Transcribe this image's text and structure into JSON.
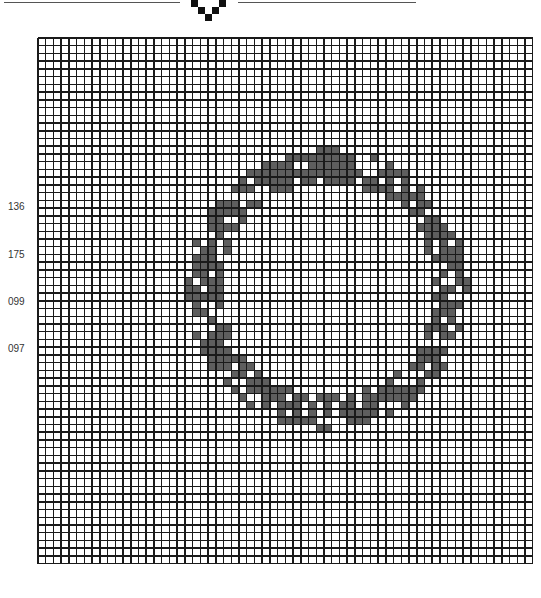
{
  "header": {
    "motif": "v-shaped-pixel-divider",
    "line_color": "#555555"
  },
  "legend": [
    {
      "code": "136",
      "color": "#5e5e5e",
      "y": 201
    },
    {
      "code": "175",
      "color": "#cfcfcf",
      "y": 249
    },
    {
      "code": "099",
      "color": "#7a7a7a",
      "y": 296
    },
    {
      "code": "097",
      "color": "#b4b4b4",
      "y": 343
    }
  ],
  "grid": {
    "cols": 64,
    "rows": 68,
    "cell": 7.73,
    "line_color": "#1a1a1a",
    "background": "#ffffff"
  },
  "pattern": {
    "shape": "wreath-ring",
    "center_col": 37.5,
    "center_row": 32.5,
    "radius_cols": 16,
    "radius_rows": 16,
    "thickness": 3,
    "palette": [
      "136",
      "175",
      "099",
      "097"
    ]
  }
}
